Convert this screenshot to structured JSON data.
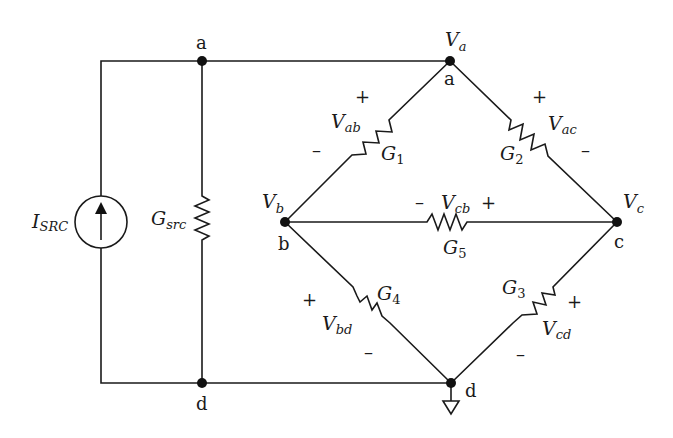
{
  "diagram": {
    "type": "circuit-schematic",
    "title": "",
    "nodes": [
      {
        "id": "a_left",
        "label": "a",
        "x": 202,
        "y": 61
      },
      {
        "id": "a_right",
        "label": "a",
        "voltage_label": "V",
        "voltage_sub": "a",
        "x": 450,
        "y": 61
      },
      {
        "id": "b",
        "label": "b",
        "voltage_label": "V",
        "voltage_sub": "b",
        "x": 285,
        "y": 222
      },
      {
        "id": "c",
        "label": "c",
        "voltage_label": "V",
        "voltage_sub": "c",
        "x": 617,
        "y": 222
      },
      {
        "id": "d_left",
        "label": "d",
        "x": 202,
        "y": 383
      },
      {
        "id": "d_right",
        "label": "d",
        "x": 451,
        "y": 383
      }
    ],
    "source": {
      "label": "I",
      "sub": "SRC",
      "type": "current-source",
      "direction": "up"
    },
    "components": [
      {
        "id": "Gsrc",
        "label": "G",
        "sub": "src",
        "between": [
          "a",
          "d"
        ]
      },
      {
        "id": "G1",
        "label": "G",
        "sub": "1",
        "between": [
          "a",
          "b"
        ],
        "voltage": {
          "label": "V",
          "sub": "ab",
          "plus": "+",
          "minus": "–"
        }
      },
      {
        "id": "G2",
        "label": "G",
        "sub": "2",
        "between": [
          "a",
          "c"
        ],
        "voltage": {
          "label": "V",
          "sub": "ac",
          "plus": "+",
          "minus": "–"
        }
      },
      {
        "id": "G3",
        "label": "G",
        "sub": "3",
        "between": [
          "c",
          "d"
        ],
        "voltage": {
          "label": "V",
          "sub": "cd",
          "plus": "+",
          "minus": "–"
        }
      },
      {
        "id": "G4",
        "label": "G",
        "sub": "4",
        "between": [
          "b",
          "d"
        ],
        "voltage": {
          "label": "V",
          "sub": "bd",
          "plus": "+",
          "minus": "–"
        }
      },
      {
        "id": "G5",
        "label": "G",
        "sub": "5",
        "between": [
          "c",
          "b"
        ],
        "voltage": {
          "label": "V",
          "sub": "cb",
          "plus": "+",
          "minus": "–"
        }
      }
    ],
    "ground": {
      "node": "d",
      "symbol": "ground-triangle"
    }
  }
}
